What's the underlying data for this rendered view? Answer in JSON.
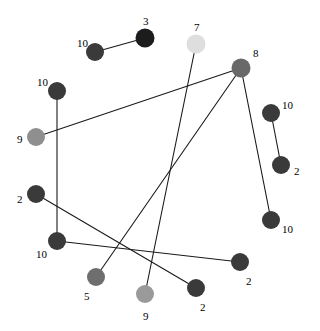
{
  "figure": {
    "type": "node-link-graph",
    "background_color": "#ffffff",
    "width": 320,
    "height": 331,
    "edge_color": "#1a1a1a",
    "edge_width": 1.1,
    "label_color": "#000000",
    "label_font_size": 11
  },
  "chart_data": {
    "type": "scatter",
    "title": "",
    "xlabel": "",
    "ylabel": "",
    "grid": false,
    "legend": "none",
    "xlim": [
      0,
      320
    ],
    "ylim": [
      0,
      331
    ],
    "nodes": [
      {
        "id": "n1",
        "label": "10",
        "x": 95,
        "y": 52,
        "r": 9.0,
        "color": "#3a3a3a",
        "label_dx": -18,
        "label_dy": -14
      },
      {
        "id": "n2",
        "label": "3",
        "x": 145,
        "y": 38,
        "r": 9.5,
        "color": "#1c1c1c",
        "label_dx": -2,
        "label_dy": -22
      },
      {
        "id": "n3",
        "label": "7",
        "x": 196,
        "y": 44,
        "r": 9.5,
        "color": "#dedede",
        "label_dx": -2,
        "label_dy": -22
      },
      {
        "id": "n4",
        "label": "8",
        "x": 241,
        "y": 68,
        "r": 9.5,
        "color": "#696969",
        "label_dx": 12,
        "label_dy": -20
      },
      {
        "id": "n5",
        "label": "10",
        "x": 57,
        "y": 91,
        "r": 9.0,
        "color": "#3a3a3a",
        "label_dx": -20,
        "label_dy": -14
      },
      {
        "id": "n6",
        "label": "9",
        "x": 36,
        "y": 137,
        "r": 9.0,
        "color": "#8f8f8f",
        "label_dx": -19,
        "label_dy": -3
      },
      {
        "id": "n7",
        "label": "10",
        "x": 271,
        "y": 113,
        "r": 9.0,
        "color": "#3a3a3a",
        "label_dx": 11,
        "label_dy": -13
      },
      {
        "id": "n8",
        "label": "2",
        "x": 281,
        "y": 165,
        "r": 9.0,
        "color": "#3a3a3a",
        "label_dx": 13,
        "label_dy": 1
      },
      {
        "id": "n9",
        "label": "2",
        "x": 36,
        "y": 194,
        "r": 9.0,
        "color": "#3a3a3a",
        "label_dx": -19,
        "label_dy": 0
      },
      {
        "id": "n10",
        "label": "10",
        "x": 271,
        "y": 220,
        "r": 9.0,
        "color": "#3a3a3a",
        "label_dx": 11,
        "label_dy": 4
      },
      {
        "id": "n11",
        "label": "10",
        "x": 57,
        "y": 241,
        "r": 9.0,
        "color": "#3a3a3a",
        "label_dx": -21,
        "label_dy": 8
      },
      {
        "id": "n12",
        "label": "2",
        "x": 240,
        "y": 262,
        "r": 9.0,
        "color": "#3a3a3a",
        "label_dx": 6,
        "label_dy": 14
      },
      {
        "id": "n13",
        "label": "5",
        "x": 96,
        "y": 277,
        "r": 9.0,
        "color": "#6e6e6e",
        "label_dx": -12,
        "label_dy": 14
      },
      {
        "id": "n14",
        "label": "2",
        "x": 196,
        "y": 288,
        "r": 9.0,
        "color": "#3a3a3a",
        "label_dx": 4,
        "label_dy": 14
      },
      {
        "id": "n15",
        "label": "9",
        "x": 145,
        "y": 294,
        "r": 9.0,
        "color": "#9a9a9a",
        "label_dx": -2,
        "label_dy": 17
      }
    ],
    "edges": [
      {
        "source": "n1",
        "target": "n2"
      },
      {
        "source": "n5",
        "target": "n11"
      },
      {
        "source": "n6",
        "target": "n4"
      },
      {
        "source": "n4",
        "target": "n10"
      },
      {
        "source": "n4",
        "target": "n13"
      },
      {
        "source": "n7",
        "target": "n8"
      },
      {
        "source": "n9",
        "target": "n14"
      },
      {
        "source": "n11",
        "target": "n12"
      },
      {
        "source": "n3",
        "target": "n15"
      }
    ]
  }
}
